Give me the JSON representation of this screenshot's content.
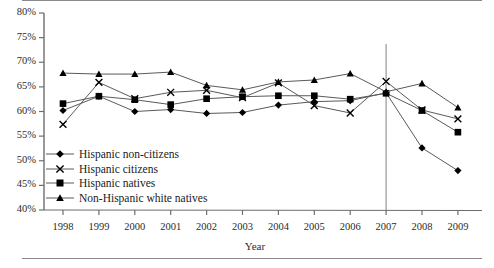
{
  "chart_data": {
    "type": "line",
    "title": "",
    "xlabel": "Year",
    "ylabel": "",
    "categories": [
      1998,
      1999,
      2000,
      2001,
      2002,
      2003,
      2004,
      2005,
      2006,
      2007,
      2008,
      2009
    ],
    "xtick_labels": [
      "1998",
      "1999",
      "2000",
      "2001",
      "2002",
      "2003",
      "2004",
      "2005",
      "2006",
      "2007",
      "2008",
      "2009"
    ],
    "ytick_labels": [
      "80%",
      "75%",
      "70%",
      "65%",
      "60%",
      "55%",
      "50%",
      "45%",
      "40%"
    ],
    "ytick_values": [
      80,
      75,
      70,
      65,
      60,
      55,
      50,
      45,
      40
    ],
    "ylim": [
      40,
      80
    ],
    "xlim": [
      1998,
      2009
    ],
    "grid": false,
    "legend_position": "inside-lower-left",
    "annotations": [
      {
        "type": "vertical-line",
        "x": 2007,
        "label": ""
      }
    ],
    "series": [
      {
        "name": "Hispanic non-citizens",
        "marker": "diamond",
        "values": [
          60.2,
          63.1,
          60.0,
          60.4,
          59.6,
          59.8,
          61.3,
          62.0,
          62.2,
          63.8,
          52.6,
          48.0
        ]
      },
      {
        "name": "Hispanic citizens",
        "marker": "x",
        "values": [
          57.4,
          65.9,
          62.6,
          63.9,
          64.3,
          62.8,
          65.8,
          61.2,
          59.7,
          66.1,
          60.3,
          58.5
        ]
      },
      {
        "name": "Hispanic natives",
        "marker": "square",
        "values": [
          61.6,
          63.1,
          62.4,
          61.4,
          62.6,
          63.0,
          63.2,
          63.2,
          62.5,
          63.7,
          60.2,
          55.8
        ]
      },
      {
        "name": "Non-Hispanic white natives",
        "marker": "triangle",
        "values": [
          67.8,
          67.6,
          67.6,
          68.0,
          65.3,
          64.4,
          66.0,
          66.4,
          67.7,
          64.0,
          65.7,
          60.8
        ]
      }
    ]
  },
  "legend": {
    "items": [
      {
        "label": "Hispanic non-citizens",
        "marker": "diamond"
      },
      {
        "label": "Hispanic citizens",
        "marker": "x"
      },
      {
        "label": "Hispanic natives",
        "marker": "square"
      },
      {
        "label": "Non-Hispanic white natives",
        "marker": "triangle"
      }
    ]
  }
}
